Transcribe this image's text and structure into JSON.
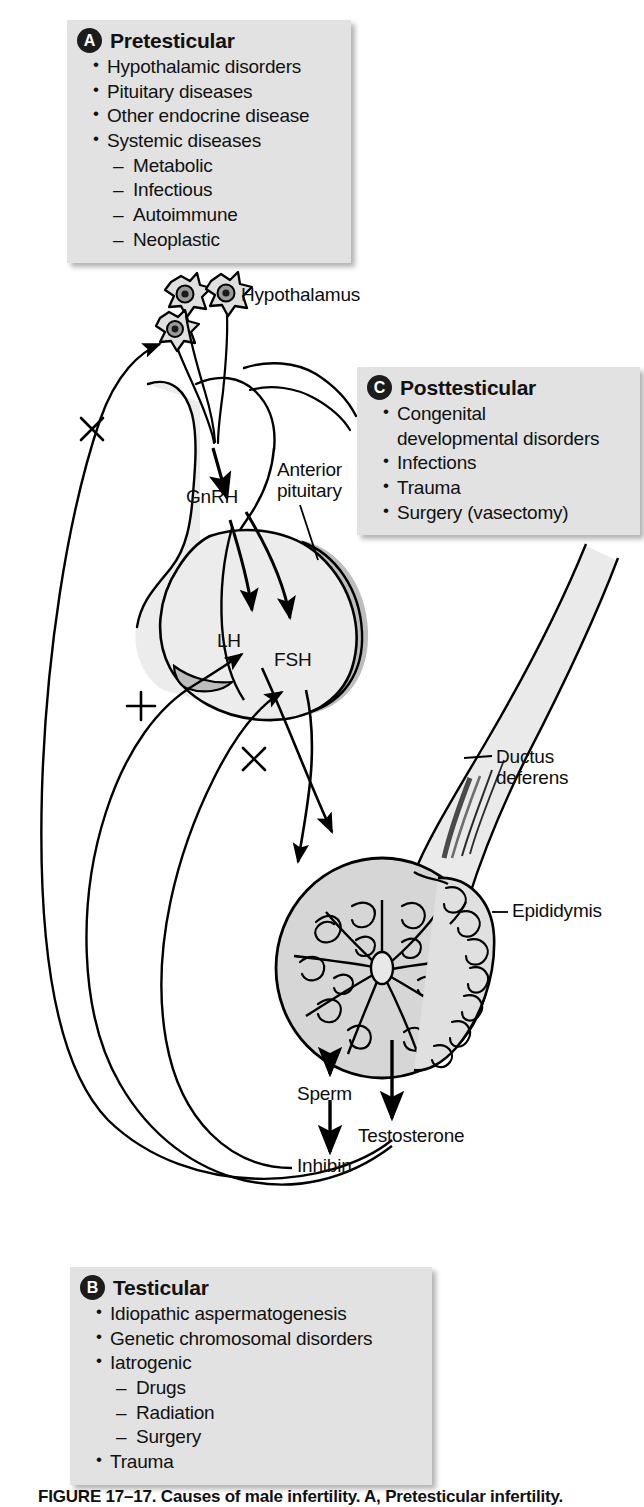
{
  "figure": {
    "title": "Causes of male infertility",
    "caption": "FIGURE 17–17. Causes of male infertility. A, Pretesticular infertility."
  },
  "boxes": [
    {
      "id": "A",
      "badge": "A",
      "title": "Pretesticular",
      "items": [
        {
          "level": 1,
          "text": "Hypothalamic disorders"
        },
        {
          "level": 1,
          "text": "Pituitary diseases"
        },
        {
          "level": 1,
          "text": "Other endocrine disease"
        },
        {
          "level": 1,
          "text": "Systemic diseases"
        },
        {
          "level": 2,
          "text": "Metabolic"
        },
        {
          "level": 2,
          "text": "Infectious"
        },
        {
          "level": 2,
          "text": "Autoimmune"
        },
        {
          "level": 2,
          "text": "Neoplastic"
        }
      ]
    },
    {
      "id": "B",
      "badge": "B",
      "title": "Testicular",
      "items": [
        {
          "level": 1,
          "text": "Idiopathic aspermatogenesis"
        },
        {
          "level": 1,
          "text": "Genetic chromosomal disorders"
        },
        {
          "level": 1,
          "text": "Iatrogenic"
        },
        {
          "level": 2,
          "text": "Drugs"
        },
        {
          "level": 2,
          "text": "Radiation"
        },
        {
          "level": 2,
          "text": "Surgery"
        },
        {
          "level": 1,
          "text": "Trauma"
        }
      ]
    },
    {
      "id": "C",
      "badge": "C",
      "title": "Posttesticular",
      "items": [
        {
          "level": 1,
          "text": "Congenital\ndevelopmental disorders"
        },
        {
          "level": 1,
          "text": "Infections"
        },
        {
          "level": 1,
          "text": "Trauma"
        },
        {
          "level": 1,
          "text": "Surgery (vasectomy)"
        }
      ]
    }
  ],
  "anatomy_labels": {
    "hypothalamus": "Hypothalamus",
    "anterior_pituitary": "Anterior\npituitary",
    "gnrh": "GnRH",
    "lh": "LH",
    "fsh": "FSH",
    "ductus_deferens": "Ductus\ndeferens",
    "epididymis": "Epididymis",
    "sperm": "Sperm",
    "testosterone": "Testosterone",
    "inhibin": "Inhibin"
  },
  "feedback_signs": {
    "negative_hypothalamus": "×",
    "positive_lh": "+",
    "negative_fsh": "×"
  },
  "colors": {
    "box_background": "#e2e2e2",
    "badge_fill": "#1c1c1c",
    "badge_text": "#ffffff",
    "text": "#111111",
    "stroke": "#000000",
    "tissue_light": "#ececec",
    "tissue_mid": "#d0d0d0",
    "tissue_dark": "#a8a8a8",
    "page_background": "#ffffff"
  }
}
